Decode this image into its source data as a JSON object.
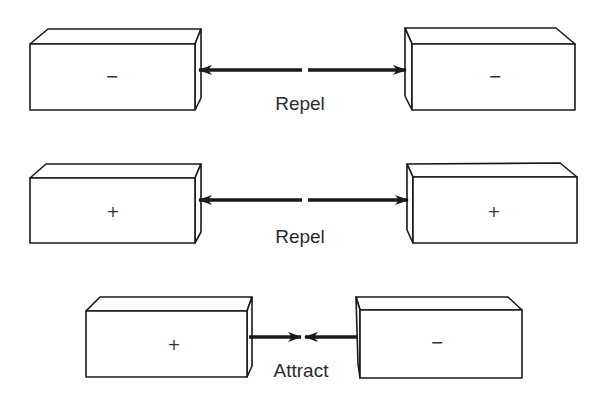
{
  "diagram": {
    "colors": {
      "stroke": "#1a1a1a",
      "text": "#2b2b2b",
      "background": "#ffffff"
    },
    "rows": [
      {
        "left_block": {
          "sign": "−"
        },
        "right_block": {
          "sign": "−"
        },
        "interaction": "Repel",
        "arrow_direction": "outward"
      },
      {
        "left_block": {
          "sign": "+"
        },
        "right_block": {
          "sign": "+"
        },
        "interaction": "Repel",
        "arrow_direction": "outward"
      },
      {
        "left_block": {
          "sign": "+"
        },
        "right_block": {
          "sign": "−"
        },
        "interaction": "Attract",
        "arrow_direction": "inward"
      }
    ]
  }
}
